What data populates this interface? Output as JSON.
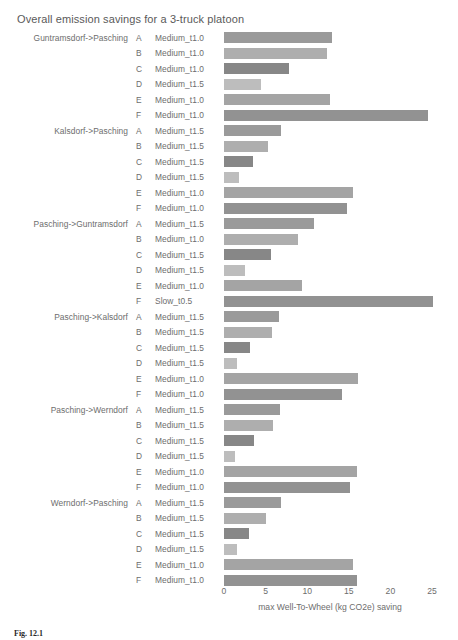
{
  "chart_data": {
    "type": "bar",
    "orientation": "horizontal",
    "title": "Overall emission savings for a 3-truck platoon",
    "xlabel": "max Well-To-Wheel (kg CO2e) saving",
    "ylabel": "",
    "xlim": [
      0,
      26.5
    ],
    "xticks": [
      0,
      5,
      10,
      15,
      20,
      25
    ],
    "xtick_labels": [
      "0",
      "5",
      "10",
      "15",
      "20",
      "25"
    ],
    "grid": false,
    "legend": "none",
    "groups": [
      {
        "name": "Guntramsdorf->Pasching",
        "rows": [
          {
            "truck": "A",
            "speed": "Medium_t1.0",
            "value": 13.0,
            "color": "#9a9a9a"
          },
          {
            "truck": "B",
            "speed": "Medium_t1.0",
            "value": 12.4,
            "color": "#aeaeae"
          },
          {
            "truck": "C",
            "speed": "Medium_t1.0",
            "value": 7.8,
            "color": "#878787"
          },
          {
            "truck": "D",
            "speed": "Medium_t1.5",
            "value": 4.5,
            "color": "#bdbdbd"
          },
          {
            "truck": "E",
            "speed": "Medium_t1.0",
            "value": 12.8,
            "color": "#a4a4a4"
          },
          {
            "truck": "F",
            "speed": "Medium_t1.0",
            "value": 24.5,
            "color": "#929292"
          }
        ]
      },
      {
        "name": "Kalsdorf->Pasching",
        "rows": [
          {
            "truck": "A",
            "speed": "Medium_t1.5",
            "value": 6.9,
            "color": "#9a9a9a"
          },
          {
            "truck": "B",
            "speed": "Medium_t1.5",
            "value": 5.3,
            "color": "#aeaeae"
          },
          {
            "truck": "C",
            "speed": "Medium_t1.5",
            "value": 3.5,
            "color": "#878787"
          },
          {
            "truck": "D",
            "speed": "Medium_t1.5",
            "value": 1.8,
            "color": "#bdbdbd"
          },
          {
            "truck": "E",
            "speed": "Medium_t1.0",
            "value": 15.5,
            "color": "#a4a4a4"
          },
          {
            "truck": "F",
            "speed": "Medium_t1.0",
            "value": 14.8,
            "color": "#929292"
          }
        ]
      },
      {
        "name": "Pasching->Guntramsdorf",
        "rows": [
          {
            "truck": "A",
            "speed": "Medium_t1.5",
            "value": 10.8,
            "color": "#9a9a9a"
          },
          {
            "truck": "B",
            "speed": "Medium_t1.0",
            "value": 8.9,
            "color": "#aeaeae"
          },
          {
            "truck": "C",
            "speed": "Medium_t1.5",
            "value": 5.6,
            "color": "#878787"
          },
          {
            "truck": "D",
            "speed": "Medium_t1.5",
            "value": 2.5,
            "color": "#bdbdbd"
          },
          {
            "truck": "E",
            "speed": "Medium_t1.0",
            "value": 9.4,
            "color": "#a4a4a4"
          },
          {
            "truck": "F",
            "speed": "Slow_t0.5",
            "value": 25.1,
            "color": "#929292"
          }
        ]
      },
      {
        "name": "Pasching->Kalsdorf",
        "rows": [
          {
            "truck": "A",
            "speed": "Medium_t1.5",
            "value": 6.6,
            "color": "#9a9a9a"
          },
          {
            "truck": "B",
            "speed": "Medium_t1.5",
            "value": 5.8,
            "color": "#aeaeae"
          },
          {
            "truck": "C",
            "speed": "Medium_t1.5",
            "value": 3.1,
            "color": "#878787"
          },
          {
            "truck": "D",
            "speed": "Medium_t1.5",
            "value": 1.6,
            "color": "#bdbdbd"
          },
          {
            "truck": "E",
            "speed": "Medium_t1.0",
            "value": 16.1,
            "color": "#a4a4a4"
          },
          {
            "truck": "F",
            "speed": "Medium_t1.0",
            "value": 14.2,
            "color": "#929292"
          }
        ]
      },
      {
        "name": "Pasching->Werndorf",
        "rows": [
          {
            "truck": "A",
            "speed": "Medium_t1.5",
            "value": 6.7,
            "color": "#9a9a9a"
          },
          {
            "truck": "B",
            "speed": "Medium_t1.5",
            "value": 5.9,
            "color": "#aeaeae"
          },
          {
            "truck": "C",
            "speed": "Medium_t1.5",
            "value": 3.6,
            "color": "#878787"
          },
          {
            "truck": "D",
            "speed": "Medium_t1.5",
            "value": 1.3,
            "color": "#bdbdbd"
          },
          {
            "truck": "E",
            "speed": "Medium_t1.0",
            "value": 16.0,
            "color": "#a4a4a4"
          },
          {
            "truck": "F",
            "speed": "Medium_t1.0",
            "value": 15.1,
            "color": "#929292"
          }
        ]
      },
      {
        "name": "Werndorf->Pasching",
        "rows": [
          {
            "truck": "A",
            "speed": "Medium_t1.5",
            "value": 6.9,
            "color": "#9a9a9a"
          },
          {
            "truck": "B",
            "speed": "Medium_t1.5",
            "value": 5.1,
            "color": "#aeaeae"
          },
          {
            "truck": "C",
            "speed": "Medium_t1.5",
            "value": 3.0,
            "color": "#878787"
          },
          {
            "truck": "D",
            "speed": "Medium_t1.5",
            "value": 1.6,
            "color": "#bdbdbd"
          },
          {
            "truck": "E",
            "speed": "Medium_t1.0",
            "value": 15.5,
            "color": "#a4a4a4"
          },
          {
            "truck": "F",
            "speed": "Medium_t1.0",
            "value": 16.0,
            "color": "#929292"
          }
        ]
      }
    ]
  },
  "caption": {
    "label": "Fig. 12.1",
    "text": ""
  }
}
